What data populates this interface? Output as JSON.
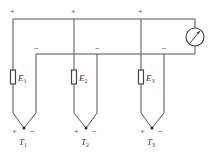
{
  "diagram": {
    "type": "thermocouple-circuit",
    "top_wire_sign": "+",
    "return_wire_sign": "−",
    "meter": {
      "icon": "galvanometer-icon"
    },
    "branches": [
      {
        "emf_label": "E",
        "emf_sub": "1",
        "junction_label": "T",
        "junction_sub": "1",
        "plus": "+",
        "minus": "−",
        "top_sign": "+",
        "return_sign": "−"
      },
      {
        "emf_label": "E",
        "emf_sub": "2",
        "junction_label": "T",
        "junction_sub": "2",
        "plus": "+",
        "minus": "−",
        "top_sign": "+",
        "return_sign": "−"
      },
      {
        "emf_label": "E",
        "emf_sub": "3",
        "junction_label": "T",
        "junction_sub": "3",
        "plus": "+",
        "minus": "−",
        "top_sign": "+",
        "return_sign": "−"
      }
    ]
  }
}
